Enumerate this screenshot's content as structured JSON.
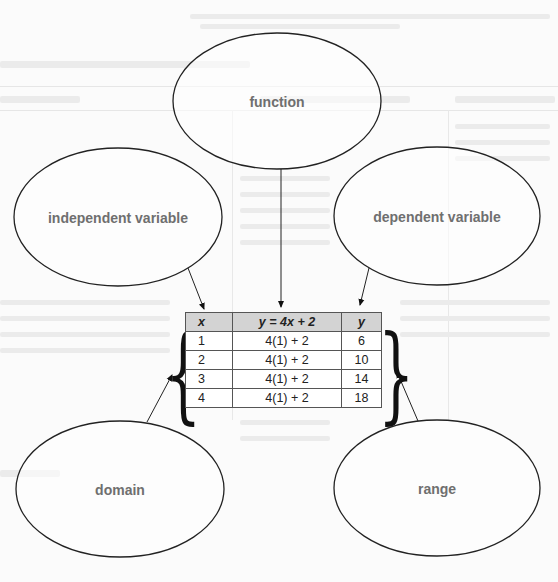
{
  "diagram": {
    "bubbles": [
      {
        "id": "function",
        "label": "function"
      },
      {
        "id": "independent",
        "label": "independent variable"
      },
      {
        "id": "dependent",
        "label": "dependent variable"
      },
      {
        "id": "domain",
        "label": "domain"
      },
      {
        "id": "range",
        "label": "range"
      }
    ],
    "table": {
      "headers": [
        "x",
        "y = 4x + 2",
        "y"
      ],
      "rows": [
        [
          "1",
          "4(1) + 2",
          "6"
        ],
        [
          "2",
          "4(1) + 2",
          "10"
        ],
        [
          "3",
          "4(1) + 2",
          "14"
        ],
        [
          "4",
          "4(1) + 2",
          "18"
        ]
      ]
    },
    "braces": {
      "left": "{",
      "right": "}"
    },
    "colors": {
      "stroke": "#222222",
      "label": "#6f6f6f",
      "header_bg": "#d3d3d3"
    }
  }
}
